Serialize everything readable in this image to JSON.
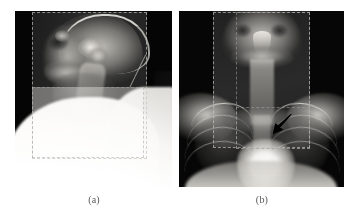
{
  "figure": {
    "background_color": "#ffffff",
    "caption_color": "#59585a",
    "panels": [
      {
        "id": "a",
        "label": "(a)",
        "modality": "x-ray",
        "view": "lateral cervical spine and skull",
        "annotation": "dashed rectangular region-of-interest overlays",
        "annotation_color": "#c4c2bc",
        "background_color": "#050505"
      },
      {
        "id": "b",
        "label": "(b)",
        "modality": "x-ray",
        "view": "anteroposterior chest and cervical spine",
        "annotation": "dashed rectangular region-of-interest overlays with pointer arrow",
        "annotation_color": "#c4c2bc",
        "background_color": "#060606",
        "marker": {
          "name": "black arrow",
          "color": "#000000",
          "direction": "down-left",
          "target": "left upper lung field lesion"
        }
      }
    ]
  },
  "captions": {
    "a": "(a)",
    "b": "(b)"
  }
}
